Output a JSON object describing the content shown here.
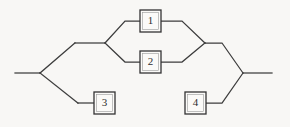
{
  "figure": {
    "type": "reliability-block-diagram",
    "background_color": "#f8f7f5",
    "line_color": "#3d3d3d",
    "block_fill": "#fbfaf8",
    "block_stroke": "#333333"
  },
  "blocks": [
    {
      "id": "block-1",
      "label": "1",
      "x": 140,
      "y": 10,
      "w": 21,
      "h": 22
    },
    {
      "id": "block-2",
      "label": "2",
      "x": 140,
      "y": 51,
      "w": 21,
      "h": 22
    },
    {
      "id": "block-3",
      "label": "3",
      "x": 94,
      "y": 92,
      "w": 21,
      "h": 22
    },
    {
      "id": "block-4",
      "label": "4",
      "x": 185,
      "y": 92,
      "w": 21,
      "h": 22
    }
  ],
  "nodes": {
    "input_start": {
      "x": 15,
      "y": 73
    },
    "left_split": {
      "x": 40,
      "y": 73
    },
    "upper_branch_corner": {
      "x": 75,
      "y": 43
    },
    "upper_fork": {
      "x": 105,
      "y": 43
    },
    "fork_up_corner": {
      "x": 125,
      "y": 21
    },
    "fork_down_corner": {
      "x": 125,
      "y": 62
    },
    "merge_up_corner": {
      "x": 182,
      "y": 21
    },
    "merge_down_corner": {
      "x": 182,
      "y": 62
    },
    "upper_merge": {
      "x": 205,
      "y": 43
    },
    "upper_right_corner": {
      "x": 222,
      "y": 43
    },
    "lower_branch_corner": {
      "x": 78,
      "y": 103
    },
    "lower_right_corner": {
      "x": 222,
      "y": 103
    },
    "right_join": {
      "x": 243,
      "y": 73
    },
    "output_end": {
      "x": 272,
      "y": 73
    }
  },
  "wire_paths": {
    "input_lead": "M15,73 L40,73",
    "upper_diagonal_in": "M40,73 L75,43",
    "upper_horizontal_in": "M75,43 L105,43",
    "fork_to_block1": "M105,43 L125,21 L140,21",
    "fork_to_block2": "M105,43 L125,62 L140,62",
    "block1_to_merge": "M161,21 L182,21 L205,43",
    "block2_to_merge": "M161,62 L182,62 L205,43",
    "merge_to_right": "M205,43 L222,43 L243,73",
    "lower_diagonal_in": "M40,73 L78,103",
    "lower_horizontal_to_block3": "M78,103 L94,103",
    "block4_to_right": "M206,103 L222,103 L243,73",
    "output_lead": "M243,73 L272,73"
  },
  "artifact_segment": {
    "description": "colored scan artifact on wire between block 3 and block 4",
    "y": 103,
    "x_start": 115,
    "x_end": 185,
    "stops": [
      {
        "offset": "0%",
        "color": "#b9b2ad"
      },
      {
        "offset": "8%",
        "color": "#ef8b94"
      },
      {
        "offset": "22%",
        "color": "#f07f8b"
      },
      {
        "offset": "40%",
        "color": "#a79099"
      },
      {
        "offset": "52%",
        "color": "#5f9a97"
      },
      {
        "offset": "64%",
        "color": "#6a9a93"
      },
      {
        "offset": "78%",
        "color": "#78827e"
      },
      {
        "offset": "100%",
        "color": "#4a4a4a"
      }
    ]
  },
  "structure": {
    "series_count": 2,
    "parallel_groups": [
      {
        "name": "group-upper",
        "members": [
          "1",
          "2"
        ]
      },
      {
        "name": "group-lower",
        "members": [
          "3",
          "4"
        ]
      }
    ]
  }
}
